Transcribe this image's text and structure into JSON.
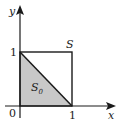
{
  "diagram": {
    "axes": {
      "x_label": "x",
      "y_label": "y",
      "origin_label": "0"
    },
    "ticks": {
      "x_one": "1",
      "y_one": "1"
    },
    "square_label": "S",
    "triangle_label": "S",
    "triangle_subscript": "0",
    "colors": {
      "shade": "#c8c8c8",
      "line": "#1a1a1a"
    }
  }
}
